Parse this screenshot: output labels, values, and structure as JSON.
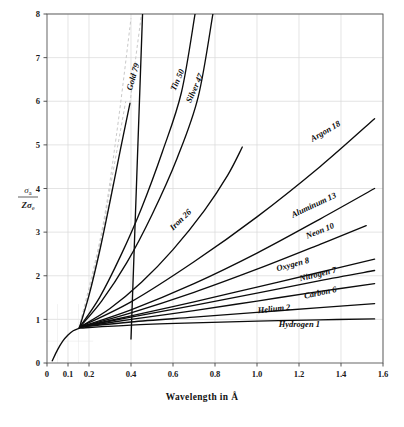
{
  "figure": {
    "background_color": "#ffffff",
    "ink_color": "#0c0c0c",
    "grid_color": "#d8d8d8",
    "dash_color": "#c9c9c9"
  },
  "chart_data": {
    "type": "line",
    "title": "",
    "xlabel": "Wavelength  in  Å",
    "ylabel": "σa / Zσe",
    "ylabel_parts": {
      "numerator": "σ",
      "numerator_sub": "a",
      "denominator_z": "Zσ",
      "denominator_sub": "e"
    },
    "xlim": [
      0,
      1.6
    ],
    "ylim": [
      0,
      8
    ],
    "grid": true,
    "legend": "inline-curve-labels",
    "xticks": [
      0,
      0.1,
      0.2,
      0.4,
      0.6,
      0.8,
      1.0,
      1.2,
      1.4,
      1.6
    ],
    "xtick_labels": [
      "0",
      "0.1",
      "0.2",
      "0.4",
      "0.6",
      "0.8",
      "1.0",
      "1.2",
      "1.4",
      "1.6"
    ],
    "yticks": [
      0,
      1,
      2,
      3,
      4,
      5,
      6,
      7,
      8
    ],
    "ytick_labels": [
      "0",
      "1",
      "2",
      "3",
      "4",
      "5",
      "6",
      "7",
      "8"
    ],
    "xminor_ticks": [
      0.05,
      0.15
    ],
    "yminor_ticks": [
      0.5
    ],
    "convergence_point": {
      "x": 0.15,
      "y": 0.8
    },
    "series": [
      {
        "name": "Gold 79",
        "atomic_number": 79,
        "label": "Gold 79",
        "label_x": 0.44,
        "label_y": 6.85,
        "label_angle": -74,
        "points": [
          [
            0.155,
            0.82
          ],
          [
            0.2,
            1.55
          ],
          [
            0.25,
            2.55
          ],
          [
            0.3,
            3.7
          ],
          [
            0.35,
            4.9
          ],
          [
            0.395,
            5.95
          ]
        ],
        "dashed_extension": [
          [
            0.395,
            5.95
          ],
          [
            0.42,
            6.9
          ],
          [
            0.45,
            8.0
          ]
        ],
        "solid_extension": [
          [
            0.4,
            0.55
          ],
          [
            0.455,
            8.0
          ]
        ]
      },
      {
        "name": "Tin 50",
        "atomic_number": 50,
        "label": "Tin 50",
        "label_x": 0.655,
        "label_y": 6.7,
        "label_angle": -66,
        "points": [
          [
            0.155,
            0.82
          ],
          [
            0.25,
            1.5
          ],
          [
            0.35,
            2.45
          ],
          [
            0.45,
            3.55
          ],
          [
            0.55,
            4.85
          ],
          [
            0.64,
            6.2
          ],
          [
            0.705,
            8.0
          ]
        ]
      },
      {
        "name": "Silver 47",
        "atomic_number": 47,
        "label": "Silver 47",
        "label_x": 0.745,
        "label_y": 6.6,
        "label_angle": -66,
        "points": [
          [
            0.155,
            0.82
          ],
          [
            0.26,
            1.42
          ],
          [
            0.38,
            2.3
          ],
          [
            0.5,
            3.4
          ],
          [
            0.62,
            4.7
          ],
          [
            0.72,
            6.1
          ],
          [
            0.79,
            8.0
          ]
        ]
      },
      {
        "name": "Iron 26",
        "atomic_number": 26,
        "label": "Iron 26",
        "label_x": 0.69,
        "label_y": 3.45,
        "label_angle": -44,
        "points": [
          [
            0.155,
            0.82
          ],
          [
            0.3,
            1.25
          ],
          [
            0.45,
            1.85
          ],
          [
            0.6,
            2.6
          ],
          [
            0.75,
            3.5
          ],
          [
            0.86,
            4.3
          ],
          [
            0.93,
            4.95
          ]
        ]
      },
      {
        "name": "Argon 18",
        "atomic_number": 18,
        "label": "Argon 18",
        "label_x": 1.4,
        "label_y": 5.45,
        "label_angle": -30,
        "points": [
          [
            0.155,
            0.82
          ],
          [
            0.4,
            1.4
          ],
          [
            0.7,
            2.32
          ],
          [
            1.0,
            3.35
          ],
          [
            1.3,
            4.5
          ],
          [
            1.56,
            5.6
          ]
        ]
      },
      {
        "name": "Aluminum 13",
        "atomic_number": 13,
        "label": "Aluminum 13",
        "label_x": 1.38,
        "label_y": 3.8,
        "label_angle": -25,
        "points": [
          [
            0.155,
            0.82
          ],
          [
            0.4,
            1.22
          ],
          [
            0.7,
            1.82
          ],
          [
            1.0,
            2.52
          ],
          [
            1.3,
            3.3
          ],
          [
            1.56,
            4.0
          ]
        ]
      },
      {
        "name": "Neon 10",
        "atomic_number": 10,
        "label": "Neon 10",
        "label_x": 1.37,
        "label_y": 3.1,
        "label_angle": -22,
        "points": [
          [
            0.155,
            0.82
          ],
          [
            0.4,
            1.15
          ],
          [
            0.7,
            1.62
          ],
          [
            1.0,
            2.15
          ],
          [
            1.3,
            2.72
          ],
          [
            1.52,
            3.15
          ]
        ]
      },
      {
        "name": "Oxygen 8",
        "atomic_number": 8,
        "label": "Oxygen 8",
        "label_x": 1.25,
        "label_y": 2.3,
        "label_angle": -15,
        "points": [
          [
            0.155,
            0.82
          ],
          [
            0.4,
            1.08
          ],
          [
            0.7,
            1.4
          ],
          [
            1.0,
            1.74
          ],
          [
            1.3,
            2.08
          ],
          [
            1.56,
            2.38
          ]
        ]
      },
      {
        "name": "Nitrogen 7",
        "atomic_number": 7,
        "label": "Nitrogen 7",
        "label_x": 1.38,
        "label_y": 2.08,
        "label_angle": -14,
        "points": [
          [
            0.155,
            0.82
          ],
          [
            0.4,
            1.05
          ],
          [
            0.7,
            1.32
          ],
          [
            1.0,
            1.6
          ],
          [
            1.3,
            1.89
          ],
          [
            1.56,
            2.12
          ]
        ]
      },
      {
        "name": "Carbon 6",
        "atomic_number": 6,
        "label": "Carbon 6",
        "label_x": 1.38,
        "label_y": 1.63,
        "label_angle": -12,
        "points": [
          [
            0.155,
            0.82
          ],
          [
            0.4,
            1.0
          ],
          [
            0.7,
            1.2
          ],
          [
            1.0,
            1.42
          ],
          [
            1.3,
            1.64
          ],
          [
            1.56,
            1.82
          ]
        ]
      },
      {
        "name": "Helium 2",
        "atomic_number": 2,
        "label": "Helium 2",
        "label_x": 1.16,
        "label_y": 1.22,
        "label_angle": -6,
        "points": [
          [
            0.155,
            0.82
          ],
          [
            0.4,
            0.94
          ],
          [
            0.7,
            1.05
          ],
          [
            1.0,
            1.16
          ],
          [
            1.3,
            1.27
          ],
          [
            1.56,
            1.36
          ]
        ]
      },
      {
        "name": "Hydrogen 1",
        "atomic_number": 1,
        "label": "Hydrogen 1",
        "label_x": 1.3,
        "label_y": 0.82,
        "label_angle": 0,
        "points": [
          [
            0.155,
            0.8
          ],
          [
            0.4,
            0.87
          ],
          [
            0.7,
            0.92
          ],
          [
            1.0,
            0.96
          ],
          [
            1.3,
            0.99
          ],
          [
            1.56,
            1.01
          ]
        ]
      },
      {
        "name": "rising-edge",
        "atomic_number": 0,
        "label": "",
        "points": [
          [
            0.025,
            0.05
          ],
          [
            0.05,
            0.3
          ],
          [
            0.075,
            0.5
          ],
          [
            0.1,
            0.64
          ],
          [
            0.125,
            0.74
          ],
          [
            0.155,
            0.8
          ]
        ],
        "is_edge": true
      }
    ],
    "dashed_guides": [
      [
        [
          0.152,
          0.8
        ],
        [
          0.26,
          3.0
        ],
        [
          0.33,
          5.2
        ],
        [
          0.4,
          7.9
        ]
      ],
      [
        [
          0.152,
          0.8
        ],
        [
          0.23,
          2.2
        ],
        [
          0.3,
          4.0
        ],
        [
          0.375,
          6.0
        ]
      ],
      [
        [
          0.152,
          0.8
        ],
        [
          0.2,
          1.6
        ],
        [
          0.26,
          2.9
        ],
        [
          0.315,
          4.1
        ]
      ],
      [
        [
          0.152,
          0.8
        ],
        [
          0.185,
          1.3
        ],
        [
          0.225,
          2.1
        ],
        [
          0.265,
          2.9
        ]
      ]
    ]
  }
}
